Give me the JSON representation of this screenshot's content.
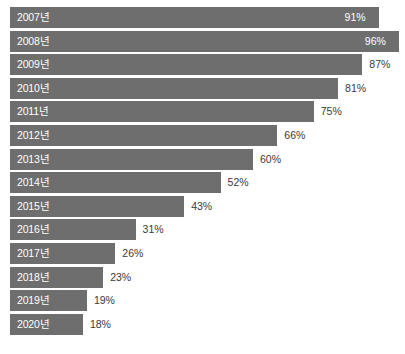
{
  "chart_data": {
    "type": "bar",
    "orientation": "horizontal",
    "title": "",
    "subtitle": "",
    "xlabel": "",
    "ylabel": "",
    "xlim": [
      0,
      100
    ],
    "grid": false,
    "legend": null,
    "value_suffix": "%",
    "categories": [
      "2007년",
      "2008년",
      "2009년",
      "2010년",
      "2011년",
      "2012년",
      "2013년",
      "2014년",
      "2015년",
      "2016년",
      "2017년",
      "2018년",
      "2019년",
      "2020년"
    ],
    "values": [
      91,
      96,
      87,
      81,
      75,
      66,
      60,
      52,
      43,
      31,
      26,
      23,
      19,
      18
    ],
    "value_labels": [
      "91%",
      "96%",
      "87%",
      "81%",
      "75%",
      "66%",
      "60%",
      "52%",
      "43%",
      "31%",
      "26%",
      "23%",
      "19%",
      "18%"
    ],
    "label_placement": [
      "inside",
      "inside",
      "outside",
      "outside",
      "outside",
      "outside",
      "outside",
      "outside",
      "outside",
      "outside",
      "outside",
      "outside",
      "outside",
      "outside"
    ],
    "bar_color": "#6e6e6e",
    "background_color": "#ffffff",
    "inside_label_color": "#ffffff",
    "outside_label_color": "#3a3a3a"
  }
}
